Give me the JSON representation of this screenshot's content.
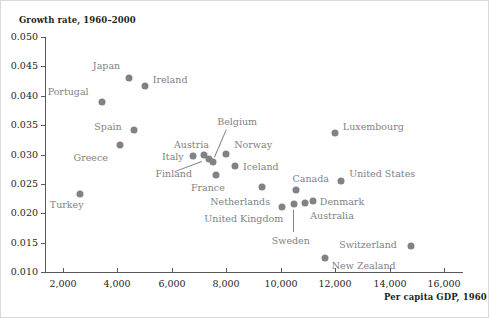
{
  "chart_data": {
    "type": "scatter",
    "title": "",
    "ylabel": "Growth rate, 1960–2000",
    "xlabel": "Per capita GDP, 1960",
    "xlim": [
      1200,
      16800
    ],
    "ylim": [
      0.01,
      0.05
    ],
    "grid": false,
    "legend": "none",
    "xticks": [
      2000,
      4000,
      6000,
      8000,
      10000,
      12000,
      14000,
      16000
    ],
    "xtick_labels": [
      "2,000",
      "4,000",
      "6,000",
      "8,000",
      "10,000",
      "12,000",
      "14,000",
      "16,000"
    ],
    "yticks": [
      0.01,
      0.015,
      0.02,
      0.025,
      0.03,
      0.035,
      0.04,
      0.045,
      0.05
    ],
    "ytick_labels": [
      "0.010",
      "0.015",
      "0.020",
      "0.025",
      "0.030",
      "0.035",
      "0.040",
      "0.045",
      "0.050"
    ],
    "marker_color": "#808285",
    "label_color": "#808285",
    "axis_color": "#58595b",
    "points": [
      {
        "name": "Turkey",
        "x": 2620,
        "y": 0.0232,
        "label_dx": -30,
        "label_dy": 11,
        "leader": false
      },
      {
        "name": "Portugal",
        "x": 3420,
        "y": 0.0389,
        "label_dx": -54,
        "label_dy": -10,
        "leader": false
      },
      {
        "name": "Greece",
        "x": 4080,
        "y": 0.0317,
        "label_dx": -46,
        "label_dy": 13,
        "leader": false
      },
      {
        "name": "Japan",
        "x": 4420,
        "y": 0.043,
        "label_dx": -36,
        "label_dy": -12,
        "leader": false
      },
      {
        "name": "Spain",
        "x": 4620,
        "y": 0.0342,
        "label_dx": -40,
        "label_dy": -3,
        "leader": false
      },
      {
        "name": "Ireland",
        "x": 5000,
        "y": 0.0416,
        "label_dx": 8,
        "label_dy": -6,
        "leader": false
      },
      {
        "name": "Italy",
        "x": 6780,
        "y": 0.0298,
        "label_dx": -31,
        "label_dy": 1,
        "leader": false
      },
      {
        "name": "Austria",
        "x": 7180,
        "y": 0.0299,
        "label_dx": -30,
        "label_dy": -10,
        "leader": false
      },
      {
        "name": "Finland",
        "x": 7380,
        "y": 0.0292,
        "label_dx": -54,
        "label_dy": 15,
        "leader": true,
        "lx1": -7,
        "ly1": 3,
        "lx2": -34,
        "ly2": 13
      },
      {
        "name": "Belgium",
        "x": 7520,
        "y": 0.0287,
        "label_dx": 4,
        "label_dy": -40,
        "leader": true,
        "lx1": 1,
        "ly1": -5,
        "lx2": 13,
        "ly2": -33
      },
      {
        "name": "France",
        "x": 7620,
        "y": 0.0265,
        "label_dx": -25,
        "label_dy": 13,
        "leader": false
      },
      {
        "name": "Norway",
        "x": 8000,
        "y": 0.0301,
        "label_dx": 8,
        "label_dy": -9,
        "leader": false
      },
      {
        "name": "Iceland",
        "x": 8320,
        "y": 0.0281,
        "label_dx": 8,
        "label_dy": 1,
        "leader": false
      },
      {
        "name": "Netherlands",
        "x": 9320,
        "y": 0.0245,
        "label_dx": -52,
        "label_dy": 15,
        "leader": false
      },
      {
        "name": "United Kingdom",
        "x": 10060,
        "y": 0.0211,
        "label_dx": -78,
        "label_dy": 12,
        "leader": false
      },
      {
        "name": "Sweden",
        "x": 10480,
        "y": 0.0215,
        "label_dx": -22,
        "label_dy": 37,
        "leader": true,
        "lx1": 0,
        "ly1": 6,
        "lx2": 0,
        "ly2": 28
      },
      {
        "name": "Canada",
        "x": 10580,
        "y": 0.024,
        "label_dx": -4,
        "label_dy": -11,
        "leader": false
      },
      {
        "name": "Australia",
        "x": 10900,
        "y": 0.0218,
        "label_dx": 5,
        "label_dy": 13,
        "leader": false
      },
      {
        "name": "Denmark",
        "x": 11180,
        "y": 0.0221,
        "label_dx": 7,
        "label_dy": 1,
        "leader": false
      },
      {
        "name": "New Zealand",
        "x": 11620,
        "y": 0.0123,
        "label_dx": 7,
        "label_dy": 8,
        "leader": false
      },
      {
        "name": "Luxembourg",
        "x": 11990,
        "y": 0.0337,
        "label_dx": 8,
        "label_dy": -6,
        "leader": false
      },
      {
        "name": "United States",
        "x": 12220,
        "y": 0.0255,
        "label_dx": 8,
        "label_dy": -7,
        "leader": false
      },
      {
        "name": "Switzerland",
        "x": 14800,
        "y": 0.0145,
        "label_dx": -72,
        "label_dy": -1,
        "leader": false
      }
    ]
  }
}
